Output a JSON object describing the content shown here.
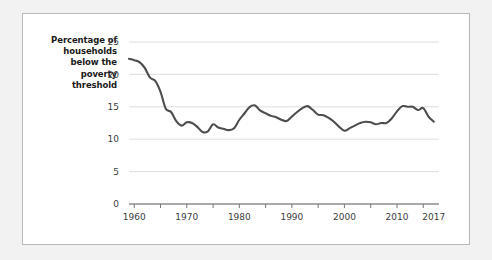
{
  "chart_data": {
    "type": "line",
    "title": "",
    "subtitle": "",
    "ylabel": "Percentage of households below the poverty threshold",
    "ylabel_lines": [
      "Percentage of",
      "households",
      "below the",
      "poverty",
      "threshold"
    ],
    "xlabel": "",
    "grid": true,
    "grid_axis": "y",
    "legend": "none",
    "line_color": "#4d4d4d",
    "line_width": 2.1,
    "plot_background": "#ffffff",
    "page_background": "#f2f2f2",
    "panel_border_color": "#b9b9b9",
    "xlim": [
      1959,
      2018
    ],
    "ylim": [
      0,
      25
    ],
    "ytick_values": [
      0,
      5,
      10,
      15,
      20,
      25
    ],
    "ytick_labels": [
      "0",
      "5",
      "10",
      "15",
      "20",
      "25"
    ],
    "xtick_values": [
      1960,
      1965,
      1970,
      1975,
      1980,
      1985,
      1990,
      1995,
      2000,
      2005,
      2010,
      2015
    ],
    "xtick_labels_shown": [
      "1960",
      "1970",
      "1980",
      "1990",
      "2000",
      "2010",
      "2017"
    ],
    "xtick_label_values": [
      1960,
      1970,
      1980,
      1990,
      2000,
      2010,
      2017
    ],
    "x": [
      1959,
      1960,
      1961,
      1962,
      1963,
      1964,
      1965,
      1966,
      1967,
      1968,
      1969,
      1970,
      1971,
      1972,
      1973,
      1974,
      1975,
      1976,
      1977,
      1978,
      1979,
      1980,
      1981,
      1982,
      1983,
      1984,
      1985,
      1986,
      1987,
      1988,
      1989,
      1990,
      1991,
      1992,
      1993,
      1994,
      1995,
      1996,
      1997,
      1998,
      1999,
      2000,
      2001,
      2002,
      2003,
      2004,
      2005,
      2006,
      2007,
      2008,
      2009,
      2010,
      2011,
      2012,
      2013,
      2014,
      2015,
      2016,
      2017
    ],
    "y": [
      22.4,
      22.2,
      21.9,
      21.0,
      19.5,
      19.0,
      17.3,
      14.7,
      14.2,
      12.8,
      12.1,
      12.6,
      12.5,
      11.9,
      11.1,
      11.2,
      12.3,
      11.8,
      11.6,
      11.4,
      11.7,
      13.0,
      14.0,
      15.0,
      15.2,
      14.4,
      14.0,
      13.6,
      13.4,
      13.0,
      12.8,
      13.5,
      14.2,
      14.8,
      15.1,
      14.5,
      13.8,
      13.7,
      13.3,
      12.7,
      11.9,
      11.3,
      11.7,
      12.1,
      12.5,
      12.7,
      12.6,
      12.3,
      12.5,
      12.5,
      13.2,
      14.3,
      15.1,
      15.0,
      15.0,
      14.5,
      14.8,
      13.5,
      12.7,
      12.3
    ],
    "annotations": []
  }
}
